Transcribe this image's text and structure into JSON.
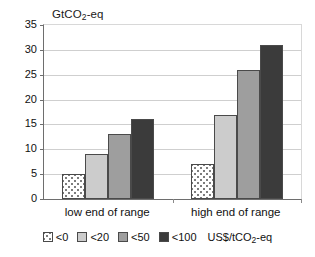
{
  "chart_data": {
    "type": "bar",
    "title": "",
    "subtitle": "",
    "ylabel": "GtCO2-eq",
    "ylabel_parts": {
      "pre": "GtCO",
      "sub": "2",
      "post": "-eq"
    },
    "xlabel": "",
    "categories": [
      "low end of range",
      "high end of range"
    ],
    "series": [
      {
        "name": "<0",
        "values": [
          5,
          7
        ],
        "color": "#ffffff",
        "pattern": "dotted"
      },
      {
        "name": "<20",
        "values": [
          9,
          17
        ],
        "color": "#cccccc",
        "pattern": "solid"
      },
      {
        "name": "<50",
        "values": [
          13,
          26
        ],
        "color": "#9e9e9e",
        "pattern": "solid"
      },
      {
        "name": "<100",
        "values": [
          16,
          31
        ],
        "color": "#3b3b3b",
        "pattern": "solid"
      }
    ],
    "ylim": [
      0,
      35
    ],
    "yticks": [
      0,
      5,
      10,
      15,
      20,
      25,
      30,
      35
    ],
    "ytick_labels": [
      "0",
      "5",
      "10",
      "15",
      "20",
      "25",
      "30",
      "35"
    ],
    "grid": true,
    "grid_axis": "y",
    "legend_position": "bottom",
    "legend_unit": "US$/tCO2-eq",
    "legend_unit_parts": {
      "pre": "US$/tCO",
      "sub": "2",
      "post": "-eq"
    }
  },
  "legend": {
    "items": [
      {
        "label": "<0"
      },
      {
        "label": "<20"
      },
      {
        "label": "<50"
      },
      {
        "label": "<100"
      }
    ]
  }
}
